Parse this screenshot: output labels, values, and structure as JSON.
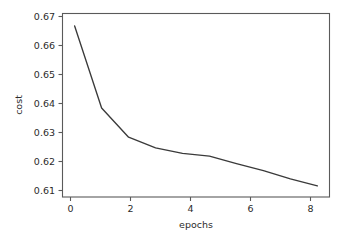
{
  "chart_data": {
    "type": "line",
    "title": "",
    "xlabel": "epochs",
    "ylabel": "cost",
    "x": [
      0,
      1,
      2,
      3,
      4,
      5,
      6,
      7,
      8,
      9
    ],
    "values": [
      0.669,
      0.6395,
      0.629,
      0.6252,
      0.6232,
      0.6222,
      0.6195,
      0.617,
      0.614,
      0.6115
    ],
    "series": [
      {
        "name": "cost",
        "values": [
          0.669,
          0.6395,
          0.629,
          0.6252,
          0.6232,
          0.6222,
          0.6195,
          0.617,
          0.614,
          0.6115
        ]
      }
    ],
    "xlim": [
      -0.45,
      9.45
    ],
    "ylim": [
      0.6075,
      0.6735
    ],
    "xticks": [
      0,
      2,
      4,
      6,
      8
    ],
    "xtick_labels": [
      "0",
      "2",
      "4",
      "6",
      "8"
    ],
    "yticks": [
      0.61,
      0.62,
      0.63,
      0.64,
      0.65,
      0.66,
      0.67
    ],
    "ytick_labels": [
      "0.61",
      "0.62",
      "0.63",
      "0.64",
      "0.65",
      "0.66",
      "0.67"
    ],
    "grid": false,
    "legend": null,
    "line_color": "#3a3a3a",
    "background_color": "#ffffff",
    "axis_color": "#5a5a5a"
  },
  "axes": {
    "xlabel": "epochs",
    "ylabel": "cost"
  },
  "ticks": {
    "y": [
      "0.67",
      "0.66",
      "0.65",
      "0.64",
      "0.63",
      "0.62",
      "0.61"
    ],
    "x": [
      "0",
      "2",
      "4",
      "6",
      "8"
    ]
  }
}
